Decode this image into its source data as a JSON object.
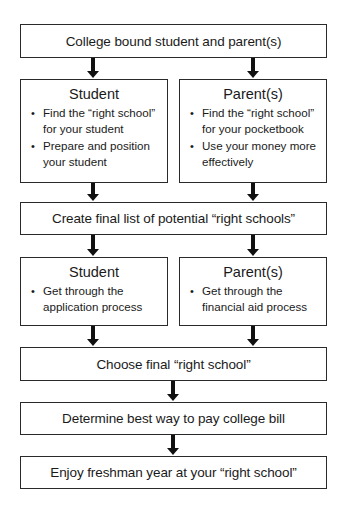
{
  "diagram": {
    "type": "flowchart",
    "nodes": {
      "start": {
        "label": "College bound student and parent(s)"
      },
      "student_1": {
        "title": "Student",
        "bullets": [
          "Find the “right school” for your student",
          "Prepare and position your student"
        ],
        "bullet_lines": [
          [
            "Find the “right school”",
            "for your student"
          ],
          [
            "Prepare and position",
            "your student"
          ]
        ]
      },
      "parent_1": {
        "title": "Parent(s)",
        "bullets": [
          "Find the “right school” for your pocketbook",
          "Use your money more effectively"
        ],
        "bullet_lines": [
          [
            "Find the “right school”",
            "for your pocketbook"
          ],
          [
            "Use your money more",
            "effectively"
          ]
        ]
      },
      "create_list": {
        "label": "Create final list of potential “right schools”"
      },
      "student_2": {
        "title": "Student",
        "bullets": [
          "Get through the application process"
        ],
        "bullet_lines": [
          [
            "Get through the",
            "application process"
          ]
        ]
      },
      "parent_2": {
        "title": "Parent(s)",
        "bullets": [
          "Get through the financial aid process"
        ],
        "bullet_lines": [
          [
            "Get through the",
            "financial aid process"
          ]
        ]
      },
      "choose": {
        "label": "Choose final “right school”"
      },
      "pay": {
        "label": "Determine best way to pay college bill"
      },
      "enjoy": {
        "label": "Enjoy freshman year at your “right school”"
      }
    },
    "edges": [
      [
        "start",
        "student_1"
      ],
      [
        "start",
        "parent_1"
      ],
      [
        "student_1",
        "create_list"
      ],
      [
        "parent_1",
        "create_list"
      ],
      [
        "create_list",
        "student_2"
      ],
      [
        "create_list",
        "parent_2"
      ],
      [
        "student_2",
        "choose"
      ],
      [
        "parent_2",
        "choose"
      ],
      [
        "choose",
        "pay"
      ],
      [
        "pay",
        "enjoy"
      ]
    ],
    "colors": {
      "border": "#2a2a2a",
      "arrow": "#111111",
      "background": "#ffffff",
      "text": "#1a1a1a"
    }
  }
}
